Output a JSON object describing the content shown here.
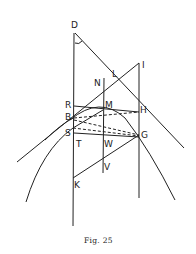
{
  "figure": {
    "caption": "Fig. 25",
    "points": {
      "D": "D",
      "N": "N",
      "L": "L",
      "I": "I",
      "R": "R",
      "M": "M",
      "H": "H",
      "B": "B",
      "S": "S",
      "T": "T",
      "W": "W",
      "G": "G",
      "V": "V",
      "K": "K"
    }
  }
}
